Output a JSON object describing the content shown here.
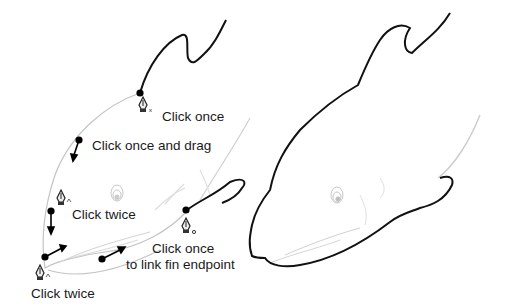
{
  "figure": {
    "left_panel": {
      "description": "Pen tool path-tracing steps on dolphin sketch",
      "labels": {
        "click_once": "Click once",
        "click_once_drag": "Click once and drag",
        "click_twice_upper": "Click twice",
        "click_once_link_line1": "Click once",
        "click_once_link_line2": "to link fin endpoint",
        "click_twice_lower": "Click twice"
      },
      "pen_cursors": [
        {
          "position": "below-top-anchor",
          "modifier": "x"
        },
        {
          "position": "beside-left-anchor",
          "modifier": "caret"
        },
        {
          "position": "below-fin-anchor",
          "modifier": "o"
        },
        {
          "position": "below-nose-anchor",
          "modifier": "caret"
        }
      ]
    },
    "right_panel": {
      "description": "Completed dolphin outline path"
    },
    "colors": {
      "path_stroke": "#111111",
      "sketch_stroke": "#bbbbbb",
      "text": "#1a1a1a",
      "background": "#ffffff"
    }
  }
}
